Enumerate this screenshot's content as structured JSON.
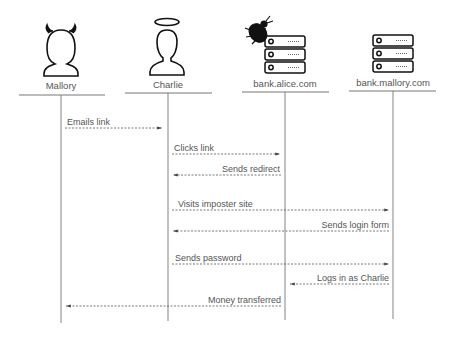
{
  "diagram": {
    "type": "sequence",
    "actors": [
      {
        "id": "mallory",
        "label": "Mallory",
        "icon": "devil-person-icon",
        "x": 61
      },
      {
        "id": "charlie",
        "label": "Charlie",
        "icon": "angel-person-icon",
        "x": 168
      },
      {
        "id": "alice",
        "label": "bank.alice.com",
        "icon": "server-with-bug-icon",
        "x": 285
      },
      {
        "id": "bankmallory",
        "label": "bank.mallory.com",
        "icon": "server-icon",
        "x": 393
      }
    ],
    "messages": [
      {
        "label": "Emails link",
        "from": "mallory",
        "to": "charlie",
        "y": 128
      },
      {
        "label": "Clicks link",
        "from": "charlie",
        "to": "alice",
        "y": 154
      },
      {
        "label": "Sends redirect",
        "from": "alice",
        "to": "charlie",
        "y": 175
      },
      {
        "label": "Visits imposter site",
        "from": "charlie",
        "to": "bankmallory",
        "y": 210
      },
      {
        "label": "Sends login form",
        "from": "bankmallory",
        "to": "charlie",
        "y": 231
      },
      {
        "label": "Sends password",
        "from": "charlie",
        "to": "bankmallory",
        "y": 264
      },
      {
        "label": "Logs in as Charlie",
        "from": "bankmallory",
        "to": "alice",
        "y": 284
      },
      {
        "label": "Money transferred",
        "from": "alice",
        "to": "mallory",
        "y": 306
      }
    ]
  }
}
